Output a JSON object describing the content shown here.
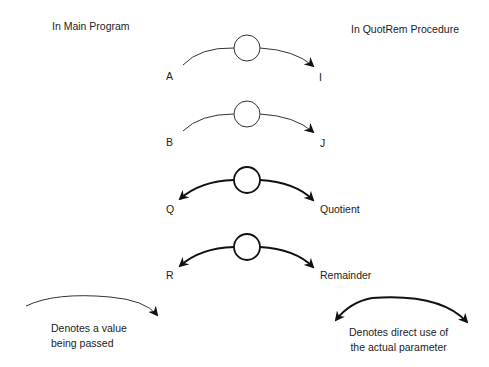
{
  "headers": {
    "left": "In Main Program",
    "right": "In QuotRem Procedure"
  },
  "rows": [
    {
      "left": "A",
      "right": "I",
      "mode": "value"
    },
    {
      "left": "B",
      "right": "J",
      "mode": "value"
    },
    {
      "left": "Q",
      "right": "Quotient",
      "mode": "reference"
    },
    {
      "left": "R",
      "right": "Remainder",
      "mode": "reference"
    }
  ],
  "legend": {
    "value": {
      "line1": "Denotes a value",
      "line2": "being passed"
    },
    "reference": {
      "line1": "Denotes direct use of",
      "line2": "the actual parameter"
    }
  }
}
